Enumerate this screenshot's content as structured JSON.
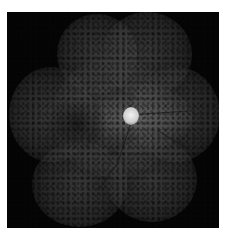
{
  "image": {
    "description": "Wide-field fundus autofluorescence montage of a retina, grayscale, on black background with white border",
    "subject": "retina",
    "features": {
      "optic_disc": "bright hyperautofluorescent disc near center",
      "vessels": "dark retinal vessels radiating from optic disc",
      "periphery": "mottled hypoautofluorescent spots throughout peripheral lobes",
      "background": "black"
    },
    "colors": {
      "border": "#ffffff",
      "background": "#050505",
      "disc": "#e8e8e8",
      "retina": "#5a5a5a"
    }
  }
}
